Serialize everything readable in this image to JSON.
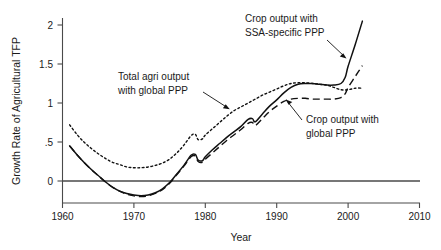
{
  "chart_data": {
    "type": "line",
    "title": "",
    "xlabel": "Year",
    "ylabel": "Growth Rate of Agricultural TFP",
    "xlim": [
      1960,
      2010
    ],
    "ylim": [
      -0.35,
      2.15
    ],
    "grid": false,
    "legend_position": "inline-annotations",
    "x_ticks": [
      "1960",
      "1970",
      "1980",
      "1990",
      "2000",
      "2010"
    ],
    "x_tick_values": [
      1960,
      1970,
      1980,
      1990,
      2000,
      2010
    ],
    "y_ticks": [
      "0",
      ".5",
      "1",
      "1.5",
      "2"
    ],
    "y_tick_values": [
      0,
      0.5,
      1,
      1.5,
      2
    ],
    "reference_lines": [
      {
        "name": "zero-line",
        "y": 0
      }
    ],
    "series": [
      {
        "name": "Crop output with SSA-specific PPP",
        "style": "solid",
        "color": "#111111",
        "x": [
          1961,
          1962,
          1963,
          1964,
          1965,
          1966,
          1967,
          1968,
          1969,
          1970,
          1971,
          1972,
          1973,
          1974,
          1975,
          1976,
          1977,
          1978,
          1978.6,
          1979,
          1979.6,
          1980,
          1981,
          1982,
          1983,
          1984,
          1985,
          1986,
          1986.6,
          1987,
          1988,
          1989,
          1990,
          1991,
          1992,
          1993,
          1994,
          1995,
          1996,
          1997,
          1998,
          1999,
          1999.6,
          2000,
          2001,
          2002
        ],
        "y": [
          0.45,
          0.34,
          0.24,
          0.15,
          0.07,
          -0.01,
          -0.08,
          -0.13,
          -0.16,
          -0.18,
          -0.19,
          -0.18,
          -0.15,
          -0.1,
          -0.02,
          0.09,
          0.2,
          0.33,
          0.34,
          0.27,
          0.26,
          0.31,
          0.4,
          0.48,
          0.56,
          0.63,
          0.7,
          0.79,
          0.8,
          0.76,
          0.86,
          0.96,
          1.04,
          1.13,
          1.2,
          1.24,
          1.25,
          1.25,
          1.24,
          1.23,
          1.23,
          1.25,
          1.33,
          1.47,
          1.75,
          2.05
        ]
      },
      {
        "name": "Crop output with global PPP",
        "style": "dashed",
        "color": "#111111",
        "x": [
          1961,
          1962,
          1963,
          1964,
          1965,
          1966,
          1967,
          1968,
          1969,
          1970,
          1971,
          1972,
          1973,
          1974,
          1975,
          1976,
          1977,
          1978,
          1978.6,
          1979,
          1979.6,
          1980,
          1981,
          1982,
          1983,
          1984,
          1985,
          1986,
          1986.6,
          1987,
          1988,
          1989,
          1990,
          1991,
          1992,
          1993,
          1994,
          1995,
          1996,
          1997,
          1998,
          1999,
          1999.6,
          2000,
          2001,
          2002
        ],
        "y": [
          0.45,
          0.34,
          0.24,
          0.15,
          0.07,
          -0.01,
          -0.08,
          -0.13,
          -0.17,
          -0.19,
          -0.2,
          -0.19,
          -0.16,
          -0.11,
          -0.03,
          0.08,
          0.19,
          0.31,
          0.32,
          0.25,
          0.24,
          0.28,
          0.36,
          0.44,
          0.52,
          0.59,
          0.66,
          0.74,
          0.75,
          0.71,
          0.8,
          0.89,
          0.96,
          1.02,
          1.05,
          1.06,
          1.06,
          1.05,
          1.05,
          1.05,
          1.05,
          1.07,
          1.12,
          1.2,
          1.34,
          1.48
        ]
      },
      {
        "name": "Total agri output with global PPP",
        "style": "dotted",
        "color": "#111111",
        "x": [
          1961,
          1962,
          1963,
          1964,
          1965,
          1966,
          1967,
          1968,
          1969,
          1970,
          1971,
          1972,
          1973,
          1974,
          1975,
          1976,
          1977,
          1978,
          1978.6,
          1979,
          1979.6,
          1980,
          1981,
          1982,
          1983,
          1984,
          1985,
          1986,
          1987,
          1988,
          1989,
          1990,
          1991,
          1992,
          1993,
          1994,
          1995,
          1996,
          1997,
          1998,
          1999,
          2000,
          2001,
          2002
        ],
        "y": [
          0.72,
          0.6,
          0.5,
          0.42,
          0.35,
          0.29,
          0.24,
          0.21,
          0.18,
          0.17,
          0.17,
          0.18,
          0.2,
          0.23,
          0.28,
          0.36,
          0.46,
          0.58,
          0.6,
          0.53,
          0.54,
          0.59,
          0.67,
          0.75,
          0.83,
          0.9,
          0.95,
          1.0,
          1.05,
          1.1,
          1.14,
          1.18,
          1.22,
          1.25,
          1.26,
          1.26,
          1.25,
          1.24,
          1.23,
          1.2,
          1.17,
          1.17,
          1.19,
          1.19
        ]
      }
    ],
    "annotations": [
      {
        "id": "annot-ssa",
        "line1": "Crop output with",
        "line2": "SSA-specific PPP",
        "target_series": "Crop output with SSA-specific PPP"
      },
      {
        "id": "annot-total",
        "line1": "Total agri output",
        "line2": "with global PPP",
        "target_series": "Total agri output with global PPP"
      },
      {
        "id": "annot-global",
        "line1": "Crop output with",
        "line2": "global PPP",
        "target_series": "Crop output with global PPP"
      }
    ]
  },
  "colors": {
    "ink": "#111111",
    "axis": "#4a4a4a",
    "background": "#ffffff"
  }
}
